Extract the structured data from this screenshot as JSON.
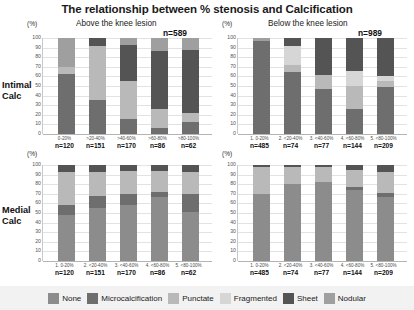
{
  "title": "The relationship between % stenosis and Calcification",
  "axis": {
    "unit_label": "(%)",
    "yticks": [
      "100",
      "90",
      "80",
      "70",
      "60",
      "50",
      "40",
      "30",
      "20",
      "10",
      "0"
    ],
    "ylim": [
      0,
      100
    ]
  },
  "panels": {
    "above": {
      "heading": "Above the knee lesion",
      "total": "n=589"
    },
    "below": {
      "heading": "Below the knee lesion",
      "total": "n=989"
    }
  },
  "rows": {
    "intimal": {
      "label_line1": "Intimal",
      "label_line2": "Calc"
    },
    "medial": {
      "label_line1": "Medial",
      "label_line2": "Calc"
    }
  },
  "legend": [
    {
      "name": "None",
      "color": "#8c8c8c"
    },
    {
      "name": "Microcalcification",
      "color": "#6e6e6e"
    },
    {
      "name": "Punctate",
      "color": "#b9b9b9"
    },
    {
      "name": "Fragmented",
      "color": "#d6d6d6"
    },
    {
      "name": "Sheet",
      "color": "#545454"
    },
    {
      "name": "Nodular",
      "color": "#9f9f9f"
    }
  ],
  "chart_data": [
    {
      "id": "intimal-above",
      "type": "bar",
      "title": "Above the knee lesion",
      "subtitle": "Intimal Calc",
      "ylabel": "(%)",
      "xlabel": "",
      "ylim": [
        0,
        100
      ],
      "grid": true,
      "legend_position": "bottom",
      "stacked": true,
      "total": "n=589",
      "categories": [
        "0-20%",
        ">20-40%",
        ">40-60%",
        ">60-80%",
        ">80-100%"
      ],
      "category_labels": [
        "0-20%",
        ">20-40%",
        ">40-60%",
        ">60-80%",
        ">80-100%"
      ],
      "counts": [
        "n=120",
        "n=151",
        "n=170",
        "n=86",
        "n=62"
      ],
      "series": [
        {
          "name": "None",
          "values": [
            0,
            0,
            0,
            0,
            0
          ]
        },
        {
          "name": "Microcalcification",
          "values": [
            62,
            35,
            16,
            6,
            13
          ]
        },
        {
          "name": "Punctate",
          "values": [
            8,
            57,
            39,
            20,
            9
          ]
        },
        {
          "name": "Fragmented",
          "values": [
            0,
            0,
            0,
            0,
            0
          ]
        },
        {
          "name": "Sheet",
          "values": [
            0,
            8,
            38,
            60,
            66
          ]
        },
        {
          "name": "Nodular",
          "values": [
            30,
            0,
            7,
            14,
            12
          ]
        }
      ]
    },
    {
      "id": "intimal-below",
      "type": "bar",
      "title": "Below the knee lesion",
      "subtitle": "Intimal Calc",
      "ylabel": "(%)",
      "xlabel": "",
      "ylim": [
        0,
        100
      ],
      "grid": true,
      "legend_position": "bottom",
      "stacked": true,
      "total": "n=989",
      "categories": [
        "1. 0-20%",
        "2. <20-40%",
        "3. <40-60%",
        "4. <60-80%",
        "5. <80-100%"
      ],
      "category_labels": [
        "1. 0-20%",
        "2. <20-40%",
        "3. <40-60%",
        "4. <60-80%",
        "5. <80-100%"
      ],
      "counts": [
        "n=485",
        "n=74",
        "n=77",
        "n=144",
        "n=209"
      ],
      "series": [
        {
          "name": "None",
          "values": [
            0,
            0,
            0,
            0,
            0
          ]
        },
        {
          "name": "Microcalcification",
          "values": [
            97,
            65,
            47,
            26,
            49
          ]
        },
        {
          "name": "Punctate",
          "values": [
            0,
            7,
            15,
            24,
            6
          ]
        },
        {
          "name": "Fragmented",
          "values": [
            0,
            20,
            0,
            16,
            5
          ]
        },
        {
          "name": "Sheet",
          "values": [
            0,
            8,
            38,
            34,
            40
          ]
        },
        {
          "name": "Nodular",
          "values": [
            3,
            0,
            0,
            0,
            0
          ]
        }
      ]
    },
    {
      "id": "medial-above",
      "type": "bar",
      "title": "Above the knee lesion",
      "subtitle": "Medial Calc",
      "ylabel": "(%)",
      "xlabel": "",
      "ylim": [
        0,
        100
      ],
      "grid": true,
      "legend_position": "bottom",
      "stacked": true,
      "categories": [
        "1. 0-20%",
        "2. <20-40%",
        "3. <40-60%",
        "4. <60-80%",
        "5. <80-100%"
      ],
      "category_labels": [
        "1. 0-20%",
        "2. <20-40%",
        "3. <40-60%",
        "4. <60-80%",
        "5. <80-100%"
      ],
      "counts": [
        "n=120",
        "n=151",
        "n=170",
        "n=86",
        "n=62"
      ],
      "series": [
        {
          "name": "None",
          "values": [
            48,
            55,
            58,
            67,
            51
          ]
        },
        {
          "name": "Microcalcification",
          "values": [
            10,
            13,
            12,
            5,
            19
          ]
        },
        {
          "name": "Punctate",
          "values": [
            35,
            25,
            24,
            22,
            23
          ]
        },
        {
          "name": "Fragmented",
          "values": [
            0,
            0,
            0,
            0,
            0
          ]
        },
        {
          "name": "Sheet",
          "values": [
            7,
            7,
            6,
            6,
            7
          ]
        },
        {
          "name": "Nodular",
          "values": [
            0,
            0,
            0,
            0,
            0
          ]
        }
      ]
    },
    {
      "id": "medial-below",
      "type": "bar",
      "title": "Below the knee lesion",
      "subtitle": "Medial Calc",
      "ylabel": "(%)",
      "xlabel": "",
      "ylim": [
        0,
        100
      ],
      "grid": true,
      "legend_position": "bottom",
      "stacked": true,
      "categories": [
        "1. 0-20%",
        "2. <20-40%",
        "3. <40-60%",
        "4. <60-80%",
        "5. <80-100%"
      ],
      "category_labels": [
        "1. 0-20%",
        "2. <20-40%",
        "3. <40-60%",
        "4. <60-80%",
        "5. <80-100%"
      ],
      "counts": [
        "n=485",
        "n=74",
        "n=77",
        "n=144",
        "n=209"
      ],
      "series": [
        {
          "name": "None",
          "values": [
            70,
            80,
            82,
            74,
            67
          ]
        },
        {
          "name": "Microcalcification",
          "values": [
            0,
            0,
            0,
            3,
            4
          ]
        },
        {
          "name": "Punctate",
          "values": [
            28,
            18,
            16,
            18,
            22
          ]
        },
        {
          "name": "Fragmented",
          "values": [
            0,
            0,
            0,
            0,
            0
          ]
        },
        {
          "name": "Sheet",
          "values": [
            2,
            2,
            2,
            5,
            7
          ]
        },
        {
          "name": "Nodular",
          "values": [
            0,
            0,
            0,
            0,
            0
          ]
        }
      ]
    }
  ]
}
